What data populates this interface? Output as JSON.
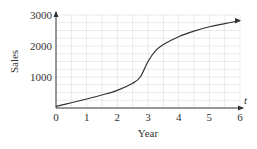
{
  "chart_data": {
    "type": "line",
    "title": "",
    "xlabel": "Year",
    "ylabel": "Sales",
    "x_axis_var": "t",
    "xlim": [
      0,
      6
    ],
    "ylim": [
      0,
      3000
    ],
    "x_ticks": [
      "0",
      "1",
      "2",
      "3",
      "4",
      "5",
      "6"
    ],
    "y_ticks": [
      "1000",
      "2000",
      "3000"
    ],
    "grid": true,
    "series": [
      {
        "name": "Sales",
        "x": [
          0,
          0.5,
          1,
          1.5,
          2,
          2.5,
          2.75,
          3,
          3.25,
          3.5,
          4,
          4.5,
          5,
          5.5,
          6
        ],
        "values": [
          50,
          170,
          290,
          420,
          570,
          800,
          1000,
          1500,
          1850,
          2050,
          2300,
          2480,
          2620,
          2720,
          2820
        ]
      }
    ]
  },
  "colors": {
    "curve": "#333333",
    "grid": "#dddddd",
    "axis": "#333333"
  }
}
